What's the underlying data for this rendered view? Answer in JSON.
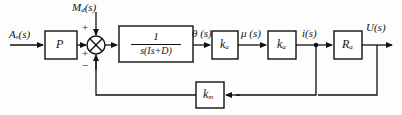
{
  "diagram": {
    "line_color": "#111111",
    "background": "#fdfdfd",
    "signals": {
      "input": "A",
      "input_sub": "s",
      "input_arg": "(s)",
      "disturbance": "M",
      "disturbance_sub": "d",
      "disturbance_arg": "(s)",
      "theta": "θ (s)",
      "mu": "μ (s)",
      "current": "i(s)",
      "output": "U(s)"
    },
    "blocks": [
      {
        "id": "gain-p",
        "label": "P",
        "sub": "",
        "x": 45,
        "y": 31,
        "w": 32,
        "h": 28
      },
      {
        "id": "plant",
        "label": "",
        "sub": "",
        "x": 119,
        "y": 26,
        "w": 74,
        "h": 36,
        "numerator": "1",
        "denominator": "s(Is+D)"
      },
      {
        "id": "gain-ka1",
        "label": "k",
        "sub": "a",
        "x": 212,
        "y": 31,
        "w": 26,
        "h": 28
      },
      {
        "id": "gain-ka2",
        "label": "k",
        "sub": "a",
        "x": 268,
        "y": 31,
        "w": 28,
        "h": 28
      },
      {
        "id": "gain-ra",
        "label": "R",
        "sub": "a",
        "x": 334,
        "y": 31,
        "w": 28,
        "h": 28
      },
      {
        "id": "feedback-km",
        "label": "k",
        "sub": "m",
        "x": 196,
        "y": 82,
        "w": 28,
        "h": 26
      }
    ],
    "summing_junction": {
      "id": "summing-junction",
      "cx": 96,
      "cy": 45,
      "r": 9,
      "signs": [
        {
          "name": "plus-top",
          "symbol": "+",
          "x": 82,
          "y": 24
        },
        {
          "name": "plus-left",
          "symbol": "+",
          "x": 82,
          "y": 50
        },
        {
          "name": "minus-bottom",
          "symbol": "−",
          "x": 82,
          "y": 62
        }
      ]
    },
    "label_positions": {
      "input": {
        "x": 9,
        "y": 30
      },
      "disturbance": {
        "x": 72,
        "y": 4
      },
      "theta": {
        "x": 190,
        "y": 29
      },
      "mu": {
        "x": 240,
        "y": 29
      },
      "current": {
        "x": 301,
        "y": 29
      },
      "output": {
        "x": 366,
        "y": 22
      }
    }
  }
}
